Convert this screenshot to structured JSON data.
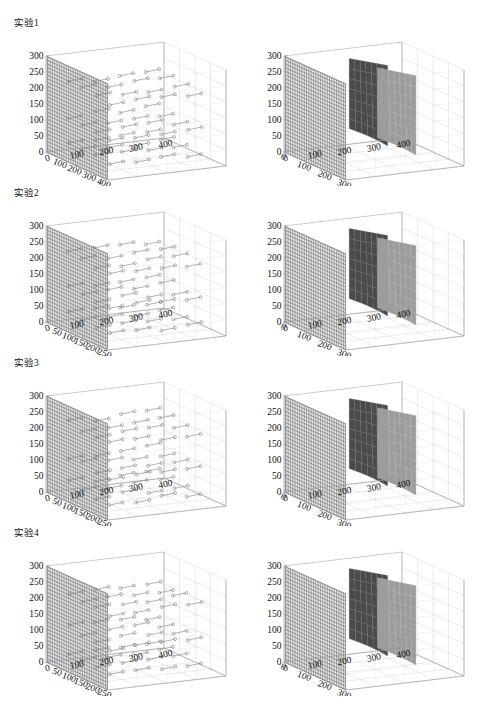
{
  "page": {
    "cut_header_text": "·· ···· ···· ·· ·· ····· ··· ····· ···· ·· ····· ····· ·· ··· ····· ····",
    "background": "#ffffff"
  },
  "colors": {
    "axis_line": "#9a9aa0",
    "grid_line": "#cfcfd4",
    "mesh_wall": "#5a5a5a",
    "surface_dark": "#4a4a4a",
    "surface_light": "#9c9c9c",
    "marker_stroke": "#777777",
    "text": "#111111"
  },
  "rows": [
    {
      "title": "实验1",
      "left": {
        "kind": "scatter3d-mesh",
        "z_ticks": [
          0,
          50,
          100,
          150,
          200,
          250,
          300
        ],
        "y_ticks": [
          100,
          200,
          300,
          400
        ],
        "x_ticks": [
          0,
          100,
          200,
          300,
          400
        ],
        "marker": "open-circle",
        "wall_plane": "yz"
      },
      "right": {
        "kind": "surface3d-mesh",
        "z_ticks": [
          0,
          50,
          100,
          150,
          200,
          250,
          300
        ],
        "y_ticks": [
          0,
          100,
          200,
          300
        ],
        "x_ticks": [
          0,
          100,
          200,
          300,
          400
        ],
        "surfaces": [
          "dark",
          "light"
        ]
      }
    },
    {
      "title": "实验2",
      "left": {
        "kind": "scatter3d-mesh",
        "z_ticks": [
          0,
          50,
          100,
          150,
          200,
          250,
          300
        ],
        "y_ticks": [
          50,
          100,
          150,
          200,
          250
        ],
        "x_ticks": [
          0,
          100,
          200,
          300,
          400
        ],
        "marker": "open-circle",
        "wall_plane": "yz"
      },
      "right": {
        "kind": "surface3d-mesh",
        "z_ticks": [
          0,
          50,
          100,
          150,
          200,
          250,
          300
        ],
        "y_ticks": [
          0,
          100,
          200,
          300
        ],
        "x_ticks": [
          0,
          100,
          200,
          300,
          400
        ],
        "surfaces": [
          "dark",
          "light"
        ]
      }
    },
    {
      "title": "实验3",
      "left": {
        "kind": "scatter3d-mesh",
        "z_ticks": [
          0,
          50,
          100,
          150,
          200,
          250,
          300
        ],
        "y_ticks": [
          50,
          100,
          150,
          200,
          250
        ],
        "x_ticks": [
          0,
          100,
          200,
          300,
          400
        ],
        "marker": "open-circle",
        "wall_plane": "yz"
      },
      "right": {
        "kind": "surface3d-mesh",
        "z_ticks": [
          0,
          50,
          100,
          150,
          200,
          250,
          300
        ],
        "y_ticks": [
          0,
          100,
          200,
          300
        ],
        "x_ticks": [
          0,
          100,
          200,
          300,
          400
        ],
        "surfaces": [
          "dark",
          "light"
        ]
      }
    },
    {
      "title": "实验4",
      "left": {
        "kind": "scatter3d-mesh",
        "z_ticks": [
          0,
          50,
          100,
          150,
          200,
          250,
          300
        ],
        "y_ticks": [
          50,
          100,
          150,
          200,
          250
        ],
        "x_ticks": [
          0,
          100,
          200,
          300,
          400
        ],
        "marker": "open-circle",
        "wall_plane": "yz"
      },
      "right": {
        "kind": "surface3d-mesh",
        "z_ticks": [
          0,
          50,
          100,
          150,
          200,
          250,
          300
        ],
        "y_ticks": [
          0,
          100,
          200,
          300
        ],
        "x_ticks": [
          0,
          100,
          200,
          300,
          400
        ],
        "surfaces": [
          "dark",
          "light"
        ]
      }
    }
  ],
  "chart_data": {
    "type": "scatter",
    "title": "",
    "panel_count": 8,
    "layout": "4 rows x 2 columns of 3-D axes",
    "panels": [
      {
        "row": 1,
        "column": "left",
        "row_label": "实验1",
        "type": "scatter",
        "projection": "3d",
        "xlabel": "",
        "ylabel": "",
        "zlabel": "",
        "xlim": [
          0,
          400
        ],
        "ylim": [
          0,
          400
        ],
        "zlim": [
          0,
          300
        ],
        "xticks": [
          0,
          100,
          200,
          300,
          400
        ],
        "yticks": [
          100,
          200,
          300,
          400
        ],
        "zticks": [
          0,
          50,
          100,
          150,
          200,
          250,
          300
        ],
        "grid": true,
        "series": [
          {
            "name": "measured-points",
            "marker": "open circle",
            "description": "clusters of circle markers joined by short line segments, arranged in three horizontal bands at approximate z = 40, 120 and 230",
            "z_bands": [
              40,
              120,
              230
            ],
            "points_per_band": 18
          },
          {
            "name": "reference-wall",
            "type": "mesh surface",
            "description": "dense dark grid wall occupying the y-z back plane from z = 0 to z = 300"
          }
        ]
      },
      {
        "row": 1,
        "column": "right",
        "row_label": "实验1",
        "type": "surface",
        "projection": "3d",
        "xlim": [
          0,
          400
        ],
        "ylim": [
          0,
          300
        ],
        "zlim": [
          0,
          300
        ],
        "xticks": [
          0,
          100,
          200,
          300,
          400
        ],
        "yticks": [
          0,
          100,
          200,
          300
        ],
        "zticks": [
          0,
          50,
          100,
          150,
          200,
          250,
          300
        ],
        "grid": true,
        "series": [
          {
            "name": "mesh-wall",
            "color": "#5a5a5a",
            "description": "gridded back wall, z = 0..300"
          },
          {
            "name": "surface-dark",
            "color": "#4a4a4a",
            "z_range": [
              60,
              280
            ],
            "description": "dark curved surface patch"
          },
          {
            "name": "surface-light",
            "color": "#9c9c9c",
            "z_range": [
              20,
              240
            ],
            "description": "light grey curved surface patch in front"
          }
        ]
      },
      {
        "row": 2,
        "column": "left",
        "row_label": "实验2",
        "type": "scatter",
        "projection": "3d",
        "xlim": [
          0,
          400
        ],
        "ylim": [
          0,
          250
        ],
        "zlim": [
          0,
          300
        ],
        "xticks": [
          0,
          100,
          200,
          300,
          400
        ],
        "yticks": [
          50,
          100,
          150,
          200,
          250
        ],
        "zticks": [
          0,
          50,
          100,
          150,
          200,
          250,
          300
        ],
        "grid": true,
        "series": [
          {
            "name": "measured-points",
            "marker": "open circle",
            "z_bands": [
              40,
              120,
              230
            ],
            "points_per_band": 22,
            "description": "circle markers joined in short runs, three bands"
          },
          {
            "name": "reference-wall",
            "type": "mesh surface",
            "description": "dense grid wall on back y-z plane"
          }
        ]
      },
      {
        "row": 2,
        "column": "right",
        "row_label": "实验2",
        "type": "surface",
        "projection": "3d",
        "xlim": [
          0,
          400
        ],
        "ylim": [
          0,
          300
        ],
        "zlim": [
          0,
          300
        ],
        "xticks": [
          0,
          100,
          200,
          300,
          400
        ],
        "yticks": [
          0,
          100,
          200,
          300
        ],
        "zticks": [
          0,
          50,
          100,
          150,
          200,
          250,
          300
        ],
        "grid": true,
        "series": [
          {
            "name": "mesh-wall",
            "color": "#5a5a5a"
          },
          {
            "name": "surface-dark",
            "color": "#4a4a4a",
            "z_range": [
              40,
              270
            ]
          },
          {
            "name": "surface-light",
            "color": "#9c9c9c",
            "z_range": [
              15,
              235
            ]
          }
        ]
      },
      {
        "row": 3,
        "column": "left",
        "row_label": "实验3",
        "type": "scatter",
        "projection": "3d",
        "xlim": [
          0,
          400
        ],
        "ylim": [
          0,
          250
        ],
        "zlim": [
          0,
          300
        ],
        "xticks": [
          0,
          100,
          200,
          300,
          400
        ],
        "yticks": [
          50,
          100,
          150,
          200,
          250
        ],
        "zticks": [
          0,
          50,
          100,
          150,
          200,
          250,
          300
        ],
        "grid": true,
        "series": [
          {
            "name": "measured-points",
            "marker": "open circle",
            "z_bands": [
              30,
              110,
              215
            ],
            "points_per_band": 24
          },
          {
            "name": "reference-wall",
            "type": "mesh surface"
          }
        ]
      },
      {
        "row": 3,
        "column": "right",
        "row_label": "实验3",
        "type": "surface",
        "projection": "3d",
        "xlim": [
          0,
          400
        ],
        "ylim": [
          0,
          300
        ],
        "zlim": [
          0,
          300
        ],
        "xticks": [
          0,
          100,
          200,
          300,
          400
        ],
        "yticks": [
          0,
          100,
          200,
          300
        ],
        "zticks": [
          0,
          50,
          100,
          150,
          200,
          250,
          300
        ],
        "grid": true,
        "series": [
          {
            "name": "mesh-wall",
            "color": "#5a5a5a"
          },
          {
            "name": "surface-dark",
            "color": "#4a4a4a",
            "z_range": [
              40,
              270
            ]
          },
          {
            "name": "surface-light",
            "color": "#9c9c9c",
            "z_range": [
              10,
              240
            ]
          }
        ]
      },
      {
        "row": 4,
        "column": "left",
        "row_label": "实验4",
        "type": "scatter",
        "projection": "3d",
        "xlim": [
          0,
          400
        ],
        "ylim": [
          0,
          250
        ],
        "zlim": [
          0,
          300
        ],
        "xticks": [
          0,
          100,
          200,
          300,
          400
        ],
        "yticks": [
          50,
          100,
          150,
          200,
          250
        ],
        "zticks": [
          0,
          50,
          100,
          150,
          200,
          250,
          300
        ],
        "grid": true,
        "series": [
          {
            "name": "measured-points",
            "marker": "open circle",
            "z_bands": [
              30,
              110,
              215
            ],
            "points_per_band": 24
          },
          {
            "name": "reference-wall",
            "type": "mesh surface"
          }
        ]
      },
      {
        "row": 4,
        "column": "right",
        "row_label": "实验4",
        "type": "surface",
        "projection": "3d",
        "xlim": [
          0,
          400
        ],
        "ylim": [
          0,
          300
        ],
        "zlim": [
          0,
          300
        ],
        "xticks": [
          0,
          100,
          200,
          300,
          400
        ],
        "yticks": [
          0,
          100,
          200,
          300
        ],
        "zticks": [
          0,
          50,
          100,
          150,
          200,
          250,
          300
        ],
        "grid": true,
        "series": [
          {
            "name": "mesh-wall",
            "color": "#5a5a5a"
          },
          {
            "name": "surface-dark",
            "color": "#4a4a4a",
            "z_range": [
              50,
              275
            ]
          },
          {
            "name": "surface-light",
            "color": "#9c9c9c",
            "z_range": [
              20,
              245
            ]
          }
        ]
      }
    ]
  }
}
